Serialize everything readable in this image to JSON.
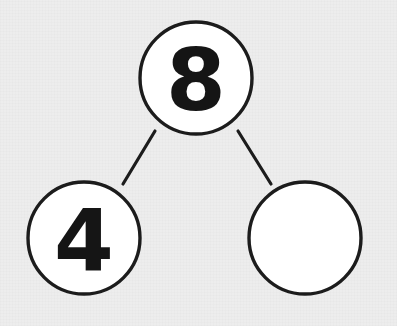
{
  "figure": {
    "type": "number-bond",
    "background_color": "#ededed",
    "circle_fill": "#ffffff",
    "stroke_color": "#1c1c1c",
    "text_color": "#151515"
  },
  "nodes": {
    "whole": {
      "role": "whole",
      "value": "8",
      "filled": true,
      "cx": 196,
      "cy": 78,
      "r": 56
    },
    "part_left": {
      "role": "part",
      "value": "4",
      "filled": true,
      "cx": 84,
      "cy": 238,
      "r": 56
    },
    "part_right": {
      "role": "part",
      "value": "",
      "filled": false,
      "cx": 305,
      "cy": 238,
      "r": 56
    }
  },
  "connectors": [
    {
      "name": "whole-to-left-part",
      "x1": 155,
      "y1": 131,
      "x2": 123,
      "y2": 184
    },
    {
      "name": "whole-to-right-part",
      "x1": 238,
      "y1": 131,
      "x2": 271,
      "y2": 184
    }
  ]
}
